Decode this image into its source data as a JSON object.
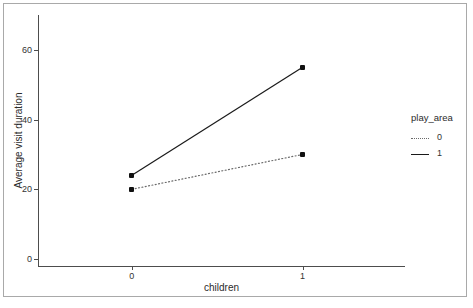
{
  "chart_data": {
    "type": "line",
    "title": "",
    "xlabel": "children",
    "ylabel": "Average visit duration",
    "x": [
      0,
      1
    ],
    "categories": [
      "0",
      "1"
    ],
    "series": [
      {
        "name": "0",
        "values": [
          20,
          30
        ],
        "linestyle": "dotted",
        "color": "#6b6b6b",
        "marker": "square"
      },
      {
        "name": "1",
        "values": [
          24,
          55
        ],
        "linestyle": "solid",
        "color": "#1a1a1a",
        "marker": "square"
      }
    ],
    "xlim": [
      -0.55,
      1.6
    ],
    "ylim": [
      -2,
      70
    ],
    "yticks": [
      0,
      20,
      40,
      60
    ],
    "ytick_labels": [
      "0",
      "20",
      "40",
      "60"
    ],
    "xticks": [
      0,
      1
    ],
    "xtick_labels": [
      "0",
      "1"
    ],
    "grid": false,
    "legend_position": "right",
    "legend_title": "play_area",
    "legend_entries": [
      {
        "label": "0",
        "linestyle": "dotted"
      },
      {
        "label": "1",
        "linestyle": "solid"
      }
    ]
  },
  "axes": {
    "x_title": "children",
    "y_title": "Average visit duration"
  },
  "legend": {
    "title": "play_area",
    "items": [
      {
        "label": "0"
      },
      {
        "label": "1"
      }
    ]
  },
  "colors": {
    "axis": "#4d4d4d",
    "frame": "#a9a9a9",
    "series_solid": "#1a1a1a",
    "series_dotted": "#6b6b6b",
    "text": "#2b2b2b",
    "background": "#ffffff"
  }
}
